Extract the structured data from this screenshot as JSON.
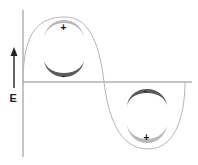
{
  "diagram": {
    "type": "wave-diagram",
    "axis_label": "E",
    "colors": {
      "axis": "#8a8a8a",
      "curve": "#b5b5b5",
      "dark_crescent": "#5a5a5a",
      "light_crescent": "#b8b8b8",
      "sign": "#111111",
      "arrow": "#222222"
    },
    "charges": [
      {
        "position": "crest-top",
        "sign": "+"
      },
      {
        "position": "crest-bottom",
        "sign": "-"
      },
      {
        "position": "trough-top",
        "sign": "-"
      },
      {
        "position": "trough-bottom",
        "sign": "+"
      }
    ]
  }
}
